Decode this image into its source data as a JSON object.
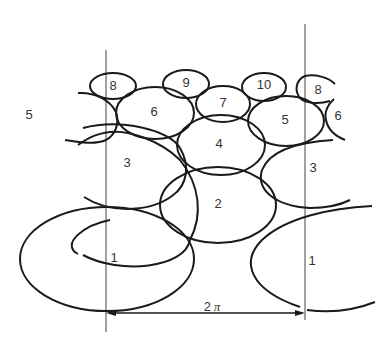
{
  "diagram": {
    "colors": {
      "stroke": "#1a1a1a",
      "guide": "#444444",
      "background": "#ffffff",
      "text": "#333333"
    },
    "period_label": "2π",
    "period_label_number": "2",
    "period_label_symbol": "π",
    "labels": [
      {
        "id": "1L",
        "text": "1",
        "x": 114,
        "y": 259
      },
      {
        "id": "1R",
        "text": "1",
        "x": 312,
        "y": 262
      },
      {
        "id": "2",
        "text": "2",
        "x": 218,
        "y": 205
      },
      {
        "id": "3L",
        "text": "3",
        "x": 127,
        "y": 164
      },
      {
        "id": "3R",
        "text": "3",
        "x": 313,
        "y": 169
      },
      {
        "id": "4",
        "text": "4",
        "x": 219,
        "y": 145
      },
      {
        "id": "5L",
        "text": "5",
        "x": 29,
        "y": 116
      },
      {
        "id": "5R",
        "text": "5",
        "x": 285,
        "y": 121
      },
      {
        "id": "6L",
        "text": "6",
        "x": 154,
        "y": 113
      },
      {
        "id": "6R",
        "text": "6",
        "x": 338,
        "y": 117
      },
      {
        "id": "7",
        "text": "7",
        "x": 223,
        "y": 104
      },
      {
        "id": "8L",
        "text": "8",
        "x": 113,
        "y": 87
      },
      {
        "id": "8R",
        "text": "8",
        "x": 318,
        "y": 91
      },
      {
        "id": "9",
        "text": "9",
        "x": 186,
        "y": 84
      },
      {
        "id": "10",
        "text": "10",
        "x": 264,
        "y": 86
      }
    ]
  }
}
